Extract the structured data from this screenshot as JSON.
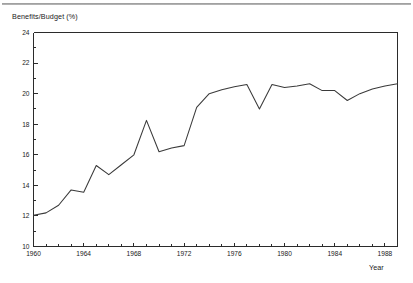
{
  "chart_data": {
    "type": "line",
    "title": "",
    "ylabel": "Benefits/Budget (%)",
    "xlabel": "Year",
    "ylim": [
      10,
      24
    ],
    "xlim": [
      1960,
      1989
    ],
    "y_major_ticks": [
      10,
      12,
      14,
      16,
      18,
      20,
      22,
      24
    ],
    "y_major_tick_labels": [
      "10",
      "12",
      "14",
      "16",
      "18",
      "20",
      "22",
      "24"
    ],
    "y_minor_tick_step": 1,
    "x_major_ticks": [
      1960,
      1964,
      1968,
      1972,
      1976,
      1980,
      1984,
      1988
    ],
    "x_major_tick_labels": [
      "1960",
      "1964",
      "1968",
      "1972",
      "1976",
      "1980",
      "1984",
      "1988"
    ],
    "x_minor_tick_step": 1,
    "grid": false,
    "legend": false,
    "series": [
      {
        "name": "Benefits/Budget",
        "color": "#3a3a3a",
        "x": [
          1960,
          1961,
          1962,
          1963,
          1964,
          1965,
          1966,
          1967,
          1968,
          1969,
          1970,
          1971,
          1972,
          1973,
          1974,
          1975,
          1976,
          1977,
          1978,
          1979,
          1980,
          1981,
          1982,
          1983,
          1984,
          1985,
          1986,
          1987,
          1988,
          1989
        ],
        "values": [
          12.05,
          12.2,
          12.7,
          13.7,
          13.55,
          15.3,
          14.7,
          15.35,
          16.0,
          18.25,
          16.2,
          16.45,
          16.6,
          19.1,
          20.0,
          20.25,
          20.45,
          20.6,
          19.0,
          20.6,
          20.4,
          20.5,
          20.65,
          20.2,
          20.2,
          19.55,
          20.0,
          20.3,
          20.5,
          20.65
        ]
      }
    ]
  },
  "figure": {
    "y_axis_title": "Benefits/Budget (%)",
    "x_axis_title": "Year"
  }
}
